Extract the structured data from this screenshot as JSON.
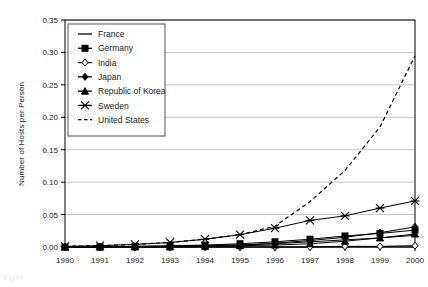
{
  "chart_data": {
    "type": "line",
    "title": "",
    "xlabel": "",
    "ylabel": "Number of Hosts per Person",
    "x": [
      1990,
      1991,
      1992,
      1993,
      1994,
      1995,
      1996,
      1997,
      1998,
      1999,
      2000
    ],
    "xtick_labels": [
      "1990",
      "1991",
      "1992",
      "1993",
      "1994",
      "1995",
      "1996",
      "1997",
      "1998",
      "1999",
      "2000"
    ],
    "ytick_labels": [
      "0.00",
      "0.05",
      "0.10",
      "0.15",
      "0.20",
      "0.25",
      "0.30",
      "0.35"
    ],
    "ytick_values": [
      0.0,
      0.05,
      0.1,
      0.15,
      0.2,
      0.25,
      0.3,
      0.35
    ],
    "ylim": [
      0.0,
      0.35
    ],
    "xlim": [
      1990,
      2000
    ],
    "grid": "horizontal",
    "legend_position": "top-left-inside",
    "series": [
      {
        "name": "France",
        "marker": "none",
        "line": "solid",
        "values": [
          0.0,
          0.0,
          0.001,
          0.001,
          0.002,
          0.003,
          0.005,
          0.008,
          0.011,
          0.014,
          0.018
        ]
      },
      {
        "name": "Germany",
        "marker": "square",
        "line": "solid",
        "values": [
          0.0,
          0.0,
          0.001,
          0.002,
          0.003,
          0.005,
          0.008,
          0.012,
          0.017,
          0.021,
          0.026
        ]
      },
      {
        "name": "India",
        "marker": "diamond-open",
        "line": "solid",
        "values": [
          0.0,
          0.0,
          0.0,
          0.0,
          0.0,
          0.0,
          0.0,
          0.0,
          0.001,
          0.001,
          0.002
        ]
      },
      {
        "name": "Japan",
        "marker": "diamond",
        "line": "solid",
        "values": [
          0.0,
          0.0,
          0.0,
          0.001,
          0.002,
          0.003,
          0.006,
          0.01,
          0.015,
          0.022,
          0.031
        ]
      },
      {
        "name": "Republic of Korea",
        "marker": "triangle",
        "line": "solid",
        "values": [
          0.0,
          0.0,
          0.0,
          0.0,
          0.001,
          0.002,
          0.003,
          0.005,
          0.009,
          0.014,
          0.02
        ]
      },
      {
        "name": "Sweden",
        "marker": "star-x",
        "line": "solid",
        "values": [
          0.001,
          0.002,
          0.004,
          0.007,
          0.012,
          0.019,
          0.029,
          0.041,
          0.048,
          0.06,
          0.071
        ]
      },
      {
        "name": "United States",
        "marker": "none",
        "line": "dashed",
        "values": [
          0.001,
          0.002,
          0.004,
          0.007,
          0.012,
          0.019,
          0.032,
          0.07,
          0.118,
          0.185,
          0.295
        ]
      }
    ]
  },
  "caption": {
    "text": "Figure"
  }
}
